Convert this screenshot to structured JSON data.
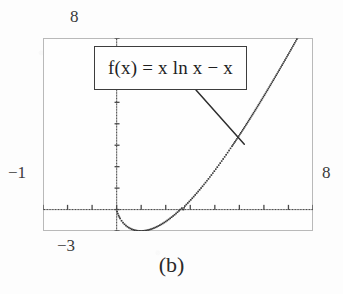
{
  "figure": {
    "caption": "(b)",
    "background_color": "#fdfdfd",
    "frame_color": "#b9b9b9"
  },
  "formula_callout": {
    "text": "f(x) = x ln x − x",
    "border_color": "#3d3d3d",
    "icon": "leader-line"
  },
  "range_labels": {
    "ymax": "8",
    "ymin": "−1",
    "xmax": "8",
    "xmin": "−3"
  },
  "chart_data": {
    "type": "scatter",
    "title": "",
    "subtitle": "",
    "xlabel": "",
    "ylabel": "",
    "annotations": [
      {
        "text": "f(x) = x ln x − x",
        "kind": "callout-box",
        "points_to_x": 5.2,
        "points_to_y": 3.05
      }
    ],
    "legend": [],
    "legend_position": "none",
    "grid": false,
    "axes_style": "dotted-with-ticks",
    "xlim": [
      -3,
      8
    ],
    "ylim": [
      -1,
      8
    ],
    "xtick_labels": [
      "−3",
      "8"
    ],
    "ytick_labels": [
      "−1",
      "8"
    ],
    "x_tick_interval": 1,
    "y_tick_interval": 1,
    "series": [
      {
        "name": "f(x) = x ln x − x",
        "marker": "dot",
        "color": "#3a3a3a",
        "x": [
          0.02,
          0.08,
          0.14,
          0.2,
          0.26,
          0.32,
          0.38,
          0.44,
          0.5,
          0.56,
          0.62,
          0.68,
          0.74,
          0.8,
          0.86,
          0.92,
          0.98,
          1.04,
          1.1,
          1.16,
          1.22,
          1.28,
          1.34,
          1.4,
          1.46,
          1.52,
          1.58,
          1.64,
          1.7,
          1.76,
          1.82,
          1.88,
          1.94,
          2.0,
          2.06,
          2.12,
          2.18,
          2.24,
          2.3,
          2.36,
          2.42,
          2.48,
          2.54,
          2.6,
          2.66,
          2.718,
          2.78,
          2.84,
          2.9,
          2.96,
          3.02,
          3.08,
          3.14,
          3.2,
          3.26,
          3.32,
          3.38,
          3.44,
          3.5,
          3.62,
          3.74,
          3.86,
          3.98,
          4.1,
          4.22,
          4.34,
          4.46,
          4.58,
          4.7,
          4.82,
          4.94,
          5.06,
          5.18,
          5.3,
          5.42,
          5.54,
          5.66,
          5.78,
          5.9,
          6.02,
          6.14,
          6.26,
          6.38,
          6.5,
          6.62,
          6.74,
          6.86,
          6.98,
          7.1,
          7.22,
          7.34,
          7.46,
          7.58,
          7.7,
          7.82,
          7.94
        ],
        "y": [
          -0.098,
          -0.282,
          -0.415,
          -0.522,
          -0.611,
          -0.685,
          -0.748,
          -0.801,
          -0.847,
          -0.884,
          -0.916,
          -0.942,
          -0.962,
          -0.978,
          -0.989,
          -0.995,
          -0.998,
          -0.996,
          -0.991,
          -0.982,
          -0.97,
          -0.954,
          -0.936,
          -0.914,
          -0.89,
          -0.863,
          -0.833,
          -0.801,
          -0.766,
          -0.729,
          -0.69,
          -0.648,
          -0.605,
          -0.559,
          -0.511,
          -0.461,
          -0.409,
          -0.355,
          -0.3,
          -0.243,
          -0.184,
          -0.123,
          -0.061,
          0.003,
          0.068,
          0.0,
          0.163,
          0.234,
          0.305,
          0.378,
          0.452,
          0.528,
          0.604,
          0.682,
          0.761,
          0.841,
          0.922,
          1.004,
          1.087,
          1.257,
          1.431,
          1.609,
          1.791,
          1.977,
          2.166,
          2.358,
          2.554,
          2.753,
          2.954,
          3.158,
          3.365,
          3.575,
          3.787,
          4.001,
          4.218,
          4.437,
          4.658,
          4.881,
          5.106,
          5.333,
          5.562,
          5.793,
          6.025,
          6.259,
          6.495,
          6.733,
          6.972,
          7.212,
          7.454,
          7.698,
          7.943,
          8.189,
          8.437,
          8.686,
          8.937,
          9.189
        ]
      }
    ]
  }
}
